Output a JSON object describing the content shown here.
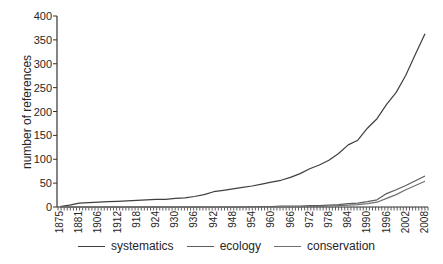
{
  "figure": {
    "background": "#ffffff",
    "axis_color": "#333333",
    "text_color": "#262626"
  },
  "chart_data": {
    "type": "line",
    "title": "",
    "xlabel": "",
    "ylabel": "number of references",
    "ylim": [
      0,
      400
    ],
    "grid": false,
    "legend_position": "bottom",
    "y_ticks": [
      0,
      50,
      100,
      150,
      200,
      250,
      300,
      350,
      400
    ],
    "x_tick_labels": [
      "1875",
      "1881",
      "1906",
      "1912",
      "918",
      "924",
      "930",
      "936",
      "942",
      "948",
      "954",
      "960",
      "966",
      "972",
      "978",
      "984",
      "1990",
      "1996",
      "2002",
      "2008"
    ],
    "series": [
      {
        "name": "systematics",
        "color": "#3f3f3f",
        "values": [
          1,
          4,
          8,
          9,
          10,
          11,
          12,
          13,
          14,
          15,
          16,
          16,
          18,
          19,
          22,
          26,
          32,
          35,
          38,
          41,
          44,
          48,
          52,
          56,
          62,
          70,
          80,
          88,
          98,
          112,
          130,
          140,
          165,
          185,
          215,
          240,
          276,
          320,
          363
        ]
      },
      {
        "name": "ecology",
        "color": "#5d5d5d",
        "values": [
          0,
          0,
          0,
          0,
          0,
          0,
          0,
          0,
          0,
          0,
          0,
          0,
          0,
          0,
          0,
          0,
          0,
          0,
          0,
          0,
          1,
          1,
          1,
          2,
          2,
          2,
          3,
          3,
          4,
          5,
          7,
          8,
          11,
          15,
          28,
          36,
          45,
          55,
          65
        ]
      },
      {
        "name": "conservation",
        "color": "#707070",
        "values": [
          0,
          0,
          0,
          0,
          0,
          0,
          0,
          0,
          0,
          0,
          0,
          0,
          0,
          0,
          0,
          0,
          0,
          0,
          0,
          0,
          0,
          0,
          0,
          0,
          0,
          0,
          1,
          1,
          2,
          3,
          4,
          5,
          7,
          10,
          18,
          26,
          36,
          45,
          54
        ]
      }
    ]
  }
}
